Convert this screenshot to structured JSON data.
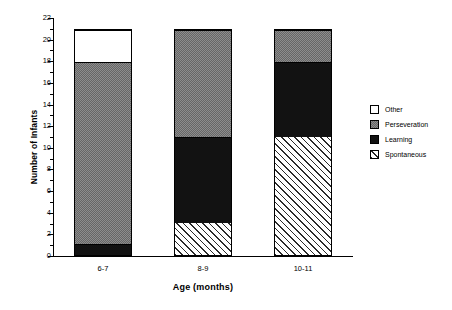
{
  "chart_data": {
    "type": "bar",
    "subtype": "stacked",
    "title": "",
    "xlabel": "Age (months)",
    "ylabel": "Number of Infants",
    "categories": [
      "6-7",
      "8-9",
      "10-11"
    ],
    "series": [
      {
        "name": "Spontaneous",
        "values": [
          0,
          3,
          11
        ],
        "color": "#ffffff",
        "pattern": "diagonal-hatch"
      },
      {
        "name": "Learning",
        "values": [
          1,
          8,
          7
        ],
        "color": "#121212",
        "pattern": "solid"
      },
      {
        "name": "Perseveration",
        "values": [
          17,
          10,
          3
        ],
        "color": "#8d8d8d",
        "pattern": "checker"
      },
      {
        "name": "Other",
        "values": [
          3,
          0,
          0
        ],
        "color": "#ffffff",
        "pattern": "solid"
      }
    ],
    "totals": [
      21,
      21,
      21
    ],
    "ylim": [
      0,
      22
    ],
    "ytick_step": 2,
    "yticks": [
      "0",
      "2",
      "4",
      "6",
      "8",
      "10",
      "12",
      "14",
      "16",
      "18",
      "20",
      "22"
    ],
    "grid": false,
    "legend_position": "right"
  },
  "axes": {
    "y_title": "Number of Infants",
    "x_title": "Age (months)",
    "y_tick_labels": [
      "22",
      "20",
      "18",
      "16",
      "14",
      "12",
      "10",
      "8",
      "6",
      "4",
      "2",
      "0"
    ],
    "x_tick_labels": [
      "6-7",
      "8-9",
      "10-11"
    ]
  },
  "legend": {
    "items": [
      {
        "label": "Other",
        "swatch": "white-swatch"
      },
      {
        "label": "Perseveration",
        "swatch": "gray-swatch"
      },
      {
        "label": "Learning",
        "swatch": "black-swatch"
      },
      {
        "label": "Spontaneous",
        "swatch": "hatch-swatch"
      }
    ]
  }
}
